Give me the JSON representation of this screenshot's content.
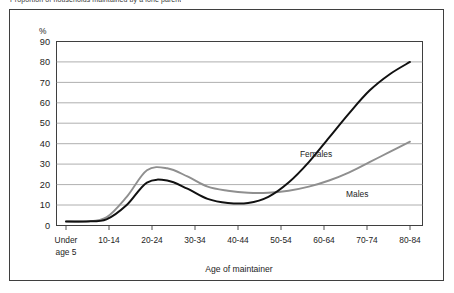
{
  "figure": {
    "title": "Proportion of households maintained by a lone parent",
    "y_unit_label": "%",
    "x_axis_title": "Age of maintainer",
    "frame_color": "#3f3f3f",
    "background": "#ffffff"
  },
  "chart_data": {
    "type": "line",
    "title": "Proportion of households maintained by a lone parent",
    "xlabel": "Age of maintainer",
    "ylabel": "%",
    "ylim": [
      0,
      90
    ],
    "ytick_step": 10,
    "yticks": [
      "0",
      "10",
      "20",
      "30",
      "40",
      "50",
      "60",
      "70",
      "80",
      "90"
    ],
    "grid": true,
    "grid_axis": "y",
    "legend": "inline-labels",
    "categories": [
      "Under age 5",
      "5-9",
      "10-14",
      "15-19",
      "20-24",
      "25-29",
      "30-34",
      "35-39",
      "40-44",
      "45-49",
      "50-54",
      "55-59",
      "60-64",
      "65-69",
      "70-74",
      "75-79",
      "80-84",
      "85+"
    ],
    "tick_labels_shown": [
      "Under age 5",
      "10-14",
      "20-24",
      "30-34",
      "40-44",
      "50-54",
      "60-64",
      "70-74",
      "80-84"
    ],
    "series": [
      {
        "name": "Females",
        "color": "#111111",
        "line_width": 2.0,
        "values": [
          2,
          2,
          3,
          10,
          21,
          22,
          18,
          13,
          11,
          11,
          14,
          21,
          31,
          43,
          55,
          66,
          74,
          80
        ]
      },
      {
        "name": "Males",
        "color": "#8f8f8f",
        "line_width": 1.9,
        "values": [
          2,
          2,
          4,
          14,
          27,
          28,
          24,
          19,
          17,
          16,
          16,
          17,
          19,
          22,
          26,
          31,
          36,
          41
        ]
      }
    ],
    "annotations": [
      {
        "text": "Females",
        "value_x": "45-49",
        "value_y": 42
      },
      {
        "text": "Males",
        "value_x": "60-64",
        "value_y": 16
      }
    ]
  },
  "labels": {
    "females": "Females",
    "males": "Males",
    "under_age_5_line1": "Under",
    "under_age_5_line2": "age 5"
  }
}
